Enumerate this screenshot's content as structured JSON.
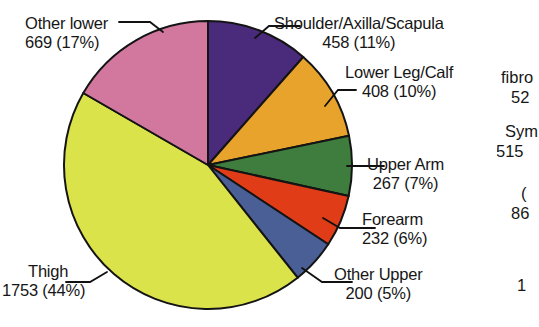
{
  "chart_data": {
    "type": "pie",
    "title": "",
    "subtitle": "",
    "xlabel": "",
    "ylabel": "",
    "legend_position": "external-labels-with-leader-lines",
    "grid": false,
    "total": 3982,
    "categories": [
      "Shoulder/Axilla/Scapula",
      "Lower Leg/Calf",
      "Upper Arm",
      "Forearm",
      "Other Upper",
      "Thigh",
      "Other lower"
    ],
    "values": [
      458,
      408,
      267,
      232,
      200,
      1753,
      669
    ],
    "percents": [
      11,
      10,
      7,
      6,
      5,
      44,
      17
    ],
    "colors": [
      "#4a2a7a",
      "#e8a32c",
      "#3f7d3f",
      "#e03c18",
      "#4a5f96",
      "#dbe34a",
      "#d2789f"
    ],
    "slices": [
      {
        "label": "Shoulder/Axilla/Scapula",
        "value": 458,
        "percent": 11,
        "value_text": "458 (11%)",
        "color": "#4a2a7a",
        "color_name": "dark-purple",
        "start_angle": 0,
        "end_angle": 41.4
      },
      {
        "label": "Lower Leg/Calf",
        "value": 408,
        "percent": 10,
        "value_text": "408 (10%)",
        "color": "#e8a32c",
        "color_name": "orange",
        "start_angle": 41.4,
        "end_angle": 78.3
      },
      {
        "label": "Upper Arm",
        "value": 267,
        "percent": 7,
        "value_text": "267 (7%)",
        "color": "#3f7d3f",
        "color_name": "green",
        "start_angle": 78.3,
        "end_angle": 102.4
      },
      {
        "label": "Forearm",
        "value": 232,
        "percent": 6,
        "value_text": "232 (6%)",
        "color": "#e03c18",
        "color_name": "red-orange",
        "start_angle": 102.4,
        "end_angle": 123.4
      },
      {
        "label": "Other Upper",
        "value": 200,
        "percent": 5,
        "value_text": "200 (5%)",
        "color": "#4a5f96",
        "color_name": "slate-blue",
        "start_angle": 123.4,
        "end_angle": 141.5
      },
      {
        "label": "Thigh",
        "value": 1753,
        "percent": 44,
        "value_text": "1753 (44%)",
        "color": "#dbe34a",
        "color_name": "yellow-green",
        "start_angle": 141.5,
        "end_angle": 300.0
      },
      {
        "label": "Other lower",
        "value": 669,
        "percent": 17,
        "value_text": "669 (17%)",
        "color": "#d2789f",
        "color_name": "pink",
        "start_angle": 300.0,
        "end_angle": 360
      }
    ]
  },
  "clipped_figure": {
    "note": "adjacent figure cut off at right edge of screenshot",
    "fragments": [
      "fibro",
      "52",
      "Sym",
      "515",
      "(",
      "86",
      "1"
    ]
  }
}
